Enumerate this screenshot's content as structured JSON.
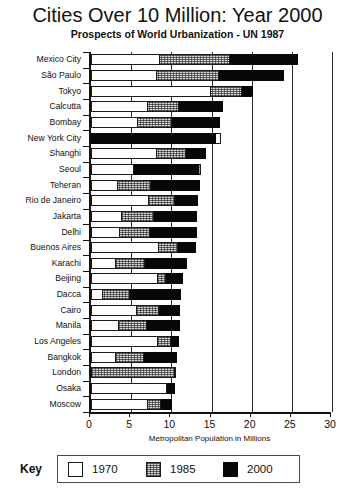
{
  "chart_data": {
    "type": "bar",
    "orientation": "horizontal",
    "stacked": "cumulative-overlay",
    "title": "Cities Over 10 Million: Year 2000",
    "subtitle": "Prospects of World Urbanization - UN 1987",
    "xlabel": "Metropolitan Population in Millions",
    "ylabel": "",
    "xlim": [
      0,
      30
    ],
    "xticks": [
      0,
      5,
      10,
      15,
      20,
      25,
      30
    ],
    "xticklabels": [
      "0",
      "5",
      "10",
      "15",
      "20",
      "25",
      "30"
    ],
    "grid": "vertical",
    "legend_position": "bottom",
    "legend_title": "Key",
    "series": [
      {
        "name": "1970",
        "color": "#ffffff"
      },
      {
        "name": "1985",
        "color": "#d8d8d8"
      },
      {
        "name": "2000",
        "color": "#070707"
      }
    ],
    "categories": [
      "Mexico City",
      "São Paulo",
      "Tokyo",
      "Calcutta",
      "Bombay",
      "New York City",
      "Shanghi",
      "Seoul",
      "Teheran",
      "Rio de Janeiro",
      "Jakarta",
      "Delhi",
      "Buenos Aires",
      "Karachi",
      "Beijing",
      "Dacca",
      "Cairo",
      "Manila",
      "Los Angeles",
      "Bangkok",
      "London",
      "Osaka",
      "Moscow"
    ],
    "values": {
      "1970": [
        8.6,
        8.2,
        14.9,
        7.1,
        5.8,
        16.2,
        8.2,
        5.4,
        3.4,
        7.2,
        3.9,
        3.6,
        8.5,
        3.1,
        8.3,
        1.5,
        5.7,
        3.5,
        8.4,
        3.1,
        10.6,
        9.4,
        7.1
      ],
      "1985": [
        17.3,
        15.9,
        18.8,
        10.9,
        10.1,
        15.6,
        11.8,
        13.7,
        7.5,
        10.4,
        7.9,
        7.4,
        10.8,
        6.7,
        9.3,
        4.9,
        8.5,
        7.0,
        10.0,
        6.6,
        10.4,
        9.5,
        8.7
      ],
      "2000": [
        25.8,
        24.0,
        20.2,
        16.4,
        16.0,
        15.5,
        14.3,
        13.5,
        13.6,
        13.3,
        13.2,
        13.2,
        13.1,
        12.0,
        11.5,
        11.2,
        11.1,
        11.1,
        10.9,
        10.7,
        10.5,
        10.5,
        10.1
      ]
    }
  }
}
